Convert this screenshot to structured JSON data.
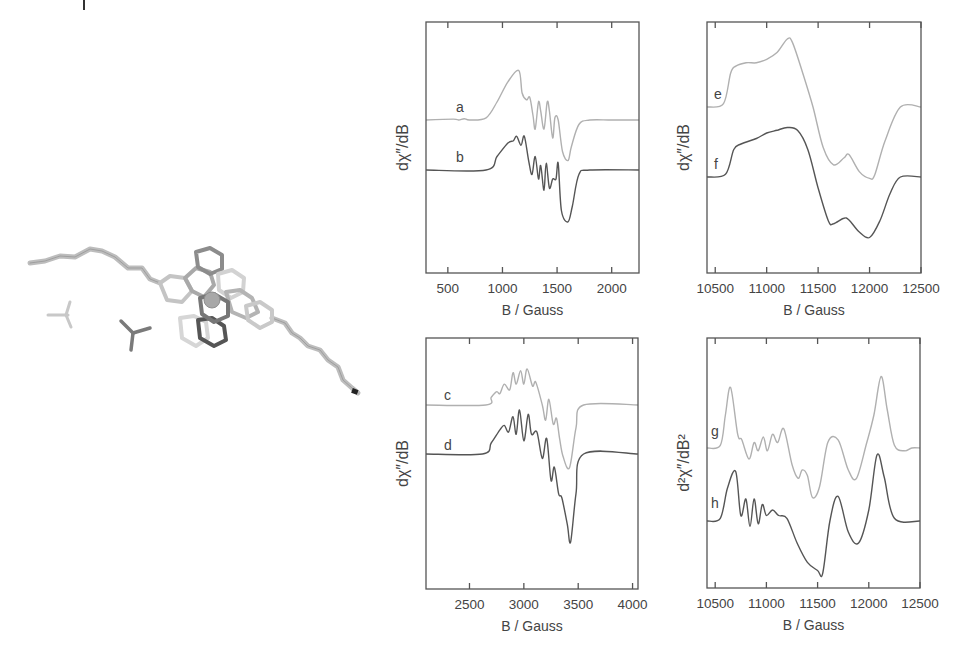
{
  "chart_data": [
    {
      "panel": "top-left",
      "type": "line",
      "xlabel": "B / Gauss",
      "ylabel": "dχ″/dB",
      "xlim": [
        300,
        2250
      ],
      "xticks": [
        500,
        1000,
        1500,
        2000
      ],
      "grid": false,
      "series": [
        {
          "name": "a",
          "color": "#b0b0b0",
          "description": "experimental-like trace, baseline offset upper",
          "x": [
            300,
            550,
            600,
            650,
            700,
            850,
            950,
            1050,
            1150,
            1180,
            1220,
            1250,
            1280,
            1300,
            1330,
            1350,
            1380,
            1410,
            1430,
            1460,
            1480,
            1510,
            1550,
            1600,
            1630,
            1700,
            1800,
            2000,
            2250
          ],
          "y": [
            0,
            0.02,
            0,
            0.03,
            0,
            0.05,
            0.4,
            0.85,
            1.1,
            0.6,
            0.45,
            0.5,
            0.1,
            -0.2,
            0.4,
            0.2,
            -0.2,
            0.4,
            0.2,
            -0.4,
            0.05,
            0.0,
            -0.7,
            -0.9,
            -0.6,
            -0.1,
            0,
            0,
            0
          ]
        },
        {
          "name": "b",
          "color": "#555555",
          "description": "simulated trace, baseline offset lower",
          "x": [
            300,
            850,
            950,
            1050,
            1100,
            1130,
            1170,
            1200,
            1240,
            1270,
            1300,
            1330,
            1350,
            1380,
            1400,
            1430,
            1460,
            1490,
            1510,
            1540,
            1600,
            1640,
            1700,
            1800,
            2250
          ],
          "y": [
            0,
            0,
            0.3,
            0.6,
            0.65,
            0.75,
            0.55,
            0.75,
            0.2,
            -0.1,
            0.3,
            -0.2,
            0.1,
            -0.45,
            0.15,
            -0.4,
            -0.2,
            -0.2,
            0.15,
            -0.9,
            -1.15,
            -0.8,
            -0.1,
            0,
            0
          ]
        }
      ]
    },
    {
      "panel": "top-right",
      "type": "line",
      "xlabel": "B / Gauss",
      "ylabel": "dχ″/dB",
      "xlim": [
        10420,
        12500
      ],
      "xticks": [
        10500,
        11000,
        11500,
        12000,
        12500
      ],
      "grid": false,
      "series": [
        {
          "name": "e",
          "color": "#b0b0b0",
          "x": [
            10420,
            10580,
            10650,
            10700,
            10800,
            10900,
            11000,
            11100,
            11200,
            11250,
            11350,
            11450,
            11550,
            11650,
            11750,
            11800,
            11900,
            12000,
            12050,
            12150,
            12300,
            12500
          ],
          "y": [
            0,
            0.05,
            0.5,
            0.6,
            0.65,
            0.65,
            0.7,
            0.8,
            1.0,
            0.95,
            0.5,
            0.0,
            -0.6,
            -0.85,
            -0.75,
            -0.7,
            -0.95,
            -1.05,
            -1.0,
            -0.5,
            0,
            0
          ]
        },
        {
          "name": "f",
          "color": "#555555",
          "x": [
            10420,
            10600,
            10680,
            10750,
            10900,
            11000,
            11100,
            11200,
            11300,
            11400,
            11500,
            11600,
            11650,
            11750,
            11800,
            11900,
            12000,
            12100,
            12200,
            12300,
            12500
          ],
          "y": [
            0,
            0.05,
            0.5,
            0.6,
            0.7,
            0.8,
            0.85,
            0.9,
            0.85,
            0.5,
            -0.2,
            -0.8,
            -0.85,
            -0.75,
            -0.78,
            -1.0,
            -1.1,
            -0.8,
            -0.3,
            0,
            0
          ]
        }
      ]
    },
    {
      "panel": "bottom-left",
      "type": "line",
      "xlabel": "B / Gauss",
      "ylabel": "dχ″/dB",
      "xlim": [
        2100,
        4050
      ],
      "xticks": [
        2500,
        3000,
        3500,
        4000
      ],
      "grid": false,
      "series": [
        {
          "name": "c",
          "color": "#b0b0b0",
          "x": [
            2100,
            2650,
            2700,
            2750,
            2780,
            2820,
            2870,
            2900,
            2930,
            2970,
            3000,
            3030,
            3080,
            3110,
            3170,
            3200,
            3230,
            3270,
            3300,
            3330,
            3360,
            3420,
            3480,
            3550,
            4050
          ],
          "y": [
            0,
            0,
            0.2,
            0.35,
            0.3,
            0.55,
            0.4,
            0.85,
            0.55,
            0.9,
            0.55,
            0.95,
            0.5,
            0.6,
            0.0,
            -0.4,
            0.15,
            -0.5,
            -0.35,
            -0.9,
            -1.35,
            -1.65,
            -0.6,
            0,
            0
          ]
        },
        {
          "name": "d",
          "color": "#555555",
          "x": [
            2100,
            2620,
            2700,
            2780,
            2820,
            2860,
            2900,
            2930,
            2960,
            3000,
            3040,
            3070,
            3120,
            3170,
            3210,
            3250,
            3280,
            3320,
            3350,
            3400,
            3430,
            3480,
            3550,
            4050
          ],
          "y": [
            0,
            0,
            0.25,
            0.55,
            0.65,
            0.5,
            0.85,
            0.45,
            1.0,
            0.3,
            0.9,
            0.45,
            0.5,
            -0.1,
            0.35,
            -0.6,
            -0.3,
            -0.9,
            -1.0,
            -1.6,
            -2.0,
            -0.9,
            0,
            0
          ]
        }
      ]
    },
    {
      "panel": "bottom-right",
      "type": "line",
      "xlabel": "B / Gauss",
      "ylabel": "d²χ″/dB²",
      "xlim": [
        10420,
        12500
      ],
      "xticks": [
        10500,
        11000,
        11500,
        12000,
        12500
      ],
      "grid": false,
      "series": [
        {
          "name": "g",
          "color": "#b0b0b0",
          "x": [
            10420,
            10550,
            10600,
            10650,
            10720,
            10760,
            10830,
            10880,
            10920,
            10970,
            11010,
            11060,
            11110,
            11170,
            11250,
            11310,
            11350,
            11400,
            11450,
            11520,
            11600,
            11700,
            11800,
            11880,
            11980,
            12050,
            12120,
            12180,
            12250,
            12350,
            12420,
            12500
          ],
          "y": [
            0,
            0.05,
            0.6,
            1.1,
            0.25,
            0.15,
            -0.2,
            0.1,
            -0.05,
            0.2,
            -0.05,
            0.25,
            0.1,
            0.35,
            -0.3,
            -0.55,
            -0.4,
            -0.5,
            -0.9,
            -0.7,
            0.1,
            0.15,
            -0.4,
            -0.55,
            0.1,
            0.6,
            1.3,
            0.7,
            0.05,
            -0.05,
            0,
            0
          ]
        },
        {
          "name": "h",
          "color": "#555555",
          "x": [
            10420,
            10550,
            10620,
            10700,
            10750,
            10800,
            10840,
            10880,
            10920,
            10960,
            11000,
            11060,
            11120,
            11200,
            11300,
            11400,
            11500,
            11550,
            11620,
            11700,
            11800,
            11900,
            12000,
            12080,
            12150,
            12250,
            12500
          ],
          "y": [
            0,
            0.05,
            0.6,
            0.9,
            0.1,
            0.4,
            -0.1,
            0.4,
            -0.05,
            0.3,
            0.1,
            0.2,
            0.1,
            0.05,
            -0.4,
            -0.75,
            -0.9,
            -0.95,
            0.0,
            0.45,
            -0.2,
            -0.4,
            0.2,
            1.2,
            0.8,
            0.05,
            0
          ]
        }
      ]
    }
  ],
  "figure": {
    "panels": [
      {
        "id": "p1",
        "ylabel": "dχ″/dB",
        "xlabel": "B / Gauss",
        "tick_labels": [
          "500",
          "1000",
          "1500",
          "2000"
        ],
        "trace_labels": [
          "a",
          "b"
        ]
      },
      {
        "id": "p2",
        "ylabel": "dχ″/dB",
        "xlabel": "B / Gauss",
        "tick_labels": [
          "10500",
          "11000",
          "11500",
          "12000",
          "12500"
        ],
        "trace_labels": [
          "e",
          "f"
        ]
      },
      {
        "id": "p3",
        "ylabel": "dχ″/dB",
        "xlabel": "B / Gauss",
        "tick_labels": [
          "2500",
          "3000",
          "3500",
          "4000"
        ],
        "trace_labels": [
          "c",
          "d"
        ]
      },
      {
        "id": "p4",
        "ylabel": "d²χ″/dB²",
        "xlabel": "B / Gauss",
        "tick_labels": [
          "10500",
          "11000",
          "11500",
          "12000",
          "12500"
        ],
        "trace_labels": [
          "g",
          "h"
        ]
      }
    ],
    "colors": {
      "light_trace": "#b0b0b0",
      "dark_trace": "#555555",
      "frame": "#555555"
    },
    "molecule": {
      "description": "3D stick model of a metal complex with two long alkyl chains and two tetrahedral counter-anions"
    }
  }
}
